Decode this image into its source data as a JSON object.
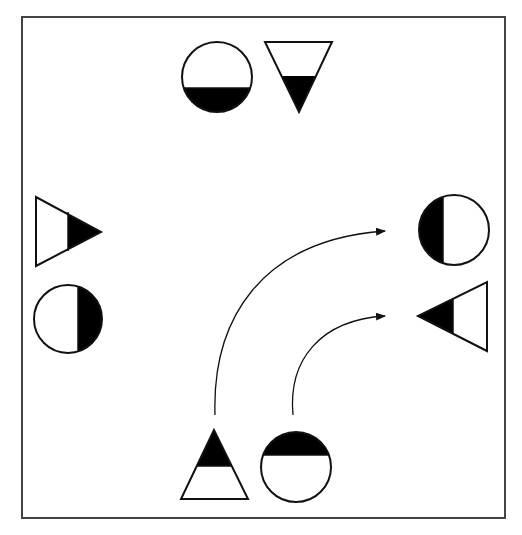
{
  "diagram": {
    "title": "",
    "frame": {
      "x": 22,
      "y": 17,
      "width": 483,
      "height": 501,
      "stroke": "#444444"
    },
    "colors": {
      "stroke": "#111111",
      "fill": "#000000",
      "background": "#ffffff"
    },
    "shapes": [
      {
        "id": "top-circle",
        "type": "circle",
        "position": "top",
        "filled_part": "bottom",
        "cx": 217,
        "cy": 77,
        "r": 35
      },
      {
        "id": "top-triangle",
        "type": "triangle",
        "orientation": "pointing-down",
        "position": "top",
        "filled_part": "apex"
      },
      {
        "id": "left-triangle",
        "type": "triangle",
        "orientation": "pointing-right",
        "position": "left",
        "filled_part": "apex"
      },
      {
        "id": "left-circle",
        "type": "circle",
        "position": "left",
        "filled_part": "right",
        "cx": 68,
        "cy": 319,
        "r": 34
      },
      {
        "id": "right-circle",
        "type": "circle",
        "position": "right",
        "filled_part": "left",
        "cx": 454,
        "cy": 230,
        "r": 35
      },
      {
        "id": "right-triangle",
        "type": "triangle",
        "orientation": "pointing-left",
        "position": "right",
        "filled_part": "apex"
      },
      {
        "id": "bottom-triangle",
        "type": "triangle",
        "orientation": "pointing-up",
        "position": "bottom",
        "filled_part": "apex"
      },
      {
        "id": "bottom-circle",
        "type": "circle",
        "position": "bottom",
        "filled_part": "top",
        "cx": 296,
        "cy": 467,
        "r": 35
      }
    ],
    "arrows": [
      {
        "id": "arrow-triangle-to-right",
        "from": "bottom-triangle",
        "to": "right-circle",
        "start": [
          215,
          415
        ],
        "end": [
          387,
          231
        ]
      },
      {
        "id": "arrow-circle-to-right",
        "from": "bottom-circle",
        "to": "right-triangle",
        "start": [
          293,
          415
        ],
        "end": [
          387,
          316
        ]
      }
    ]
  }
}
